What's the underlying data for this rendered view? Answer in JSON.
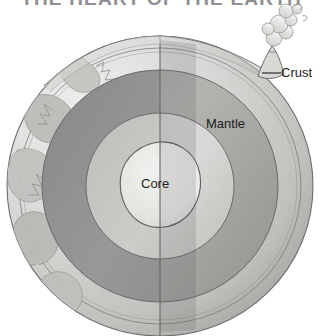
{
  "document": {
    "title": "THE HEART OF THE EARTH",
    "type": "cutaway-illustration",
    "subject": "earth-interior-structure",
    "style": "hand-drawn grayscale watercolor",
    "background_color": "#ffffff"
  },
  "labels": {
    "crust": "Crust",
    "mantle": "Mantle",
    "core": "Core"
  },
  "layers": [
    {
      "name": "Crust",
      "label": "Crust",
      "color": "#d9d9d6",
      "order": 1
    },
    {
      "name": "Mantle",
      "label": "Mantle",
      "color": "#9a9a9a",
      "order": 2
    },
    {
      "name": "Inner Mantle",
      "label": "",
      "color": "#c4c4c2",
      "order": 3
    },
    {
      "name": "Core",
      "label": "Core",
      "color": "#ececea",
      "order": 4
    }
  ],
  "features": {
    "volcano": "volcano-icon",
    "smoke_plume": "smoke-plume-icon",
    "continents": "continent-landmass",
    "leader_line": "crust-leader-line",
    "cut_plane": "vertical-cut-line"
  },
  "colors": {
    "title": "#8e8e93",
    "label_text": "#1c1c1c",
    "outline": "#555555",
    "crust_light": "#e3e3e0",
    "crust_shadow": "#bdbdba",
    "mantle_dark": "#8f8f8f",
    "mantle_mid": "#a6a6a4",
    "inner_light": "#c9c9c6",
    "core_light": "#f0f0ee",
    "ocean": "#cfcfcc",
    "land": "#b3b3b0"
  }
}
